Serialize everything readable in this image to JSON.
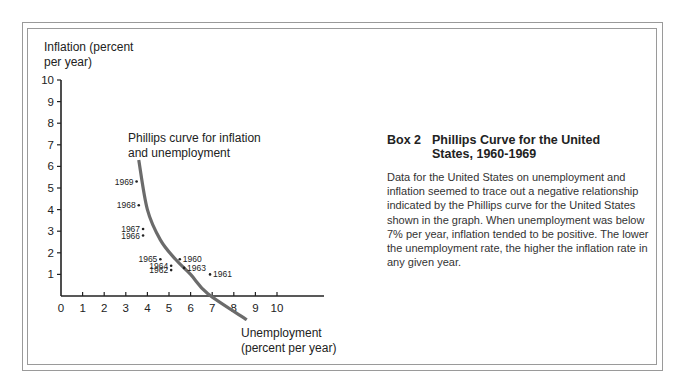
{
  "chart_data": {
    "type": "scatter",
    "title": "Phillips Curve for the United States, 1960-1969",
    "xlabel": "Unemployment (percent per year)",
    "ylabel": "Inflation (percent per year)",
    "xlim": [
      0,
      10
    ],
    "ylim": [
      0,
      10
    ],
    "x_ticks": [
      "0",
      "1",
      "2",
      "3",
      "4",
      "5",
      "6",
      "7",
      "8",
      "9",
      "10"
    ],
    "y_ticks": [
      "1",
      "2",
      "3",
      "4",
      "5",
      "6",
      "7",
      "8",
      "9",
      "10"
    ],
    "grid": false,
    "legend": null,
    "points": [
      {
        "label": "1960",
        "x": 5.5,
        "y": 1.7
      },
      {
        "label": "1961",
        "x": 6.9,
        "y": 1.0
      },
      {
        "label": "1962",
        "x": 5.1,
        "y": 1.2
      },
      {
        "label": "1963",
        "x": 5.7,
        "y": 1.3
      },
      {
        "label": "1964",
        "x": 5.1,
        "y": 1.4
      },
      {
        "label": "1965",
        "x": 4.6,
        "y": 1.7
      },
      {
        "label": "1966",
        "x": 3.8,
        "y": 2.8
      },
      {
        "label": "1967",
        "x": 3.8,
        "y": 3.1
      },
      {
        "label": "1968",
        "x": 3.6,
        "y": 4.2
      },
      {
        "label": "1969",
        "x": 3.5,
        "y": 5.3
      }
    ],
    "curve": {
      "name": "Phillips curve for inflation and unemployment",
      "approx_points": [
        [
          3.6,
          6.3
        ],
        [
          4.0,
          4.0
        ],
        [
          4.6,
          2.6
        ],
        [
          5.3,
          1.7
        ],
        [
          6.0,
          1.0
        ],
        [
          6.8,
          0.1
        ],
        [
          8.6,
          -1.1
        ]
      ]
    },
    "annotations": [
      "Phillips curve for inflation and unemployment"
    ]
  },
  "axes": {
    "y_label_line1": "Inflation (percent",
    "y_label_line2": "per year)",
    "x_label_line1": "Unemployment",
    "x_label_line2": "(percent per year)",
    "curve_label_line1": "Phillips curve for inflation",
    "curve_label_line2": "and unemployment"
  },
  "box": {
    "number": "Box 2",
    "title_line1": "Phillips Curve for the United",
    "title_line2": "States, 1960-1969",
    "body": "Data for the United States on unemployment and inflation seemed to trace out a negative relationship indicated by the Phillips curve for the United States shown in the graph. When unemployment was below 7% per year, inflation tended to be positive. The lower the unemployment rate, the higher the inflation rate in any given year."
  },
  "colors": {
    "axis": "#222222",
    "curve": "#6b6b6b",
    "frame": "#9a9a9a",
    "text": "#222222"
  }
}
